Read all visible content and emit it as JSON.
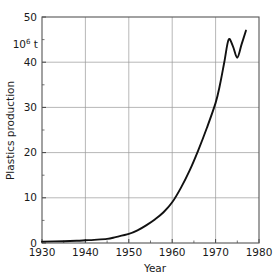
{
  "chart_data": {
    "type": "line",
    "title": "",
    "xlabel": "Year",
    "ylabel": "Plastics production",
    "unit_label": "10",
    "unit_exponent": "6",
    "unit_suffix": " t",
    "xlim": [
      1930,
      1980
    ],
    "ylim": [
      0,
      50
    ],
    "grid": true,
    "legend": "none",
    "x_major_ticks": [
      1930,
      1940,
      1950,
      1960,
      1970,
      1980
    ],
    "x_major_tick_labels": [
      "1930",
      "1940",
      "1950",
      "1960",
      "1970",
      "1980"
    ],
    "x_minor_ticks": [
      1935,
      1945,
      1955,
      1965,
      1975
    ],
    "y_major_ticks": [
      0,
      10,
      20,
      30,
      40,
      50
    ],
    "y_major_tick_labels": [
      "0",
      "10",
      "20",
      "30",
      "40",
      "50"
    ],
    "y_minor_ticks": [
      5,
      15,
      25,
      35,
      45
    ],
    "series": [
      {
        "name": "Plastics production",
        "x": [
          1930,
          1935,
          1938,
          1940,
          1942,
          1945,
          1947,
          1950,
          1952,
          1954,
          1956,
          1958,
          1960,
          1962,
          1964,
          1966,
          1968,
          1970,
          1971,
          1972,
          1973,
          1974,
          1975,
          1976,
          1977
        ],
        "values": [
          0.3,
          0.4,
          0.5,
          0.6,
          0.7,
          0.9,
          1.3,
          2.0,
          2.8,
          3.9,
          5.2,
          6.8,
          9.0,
          12.2,
          16.0,
          20.5,
          25.5,
          31.0,
          35.0,
          40.0,
          45.0,
          43.5,
          41.0,
          44.0,
          47.0
        ]
      }
    ]
  },
  "axes": {
    "x_title": "Year",
    "y_title": "Plastics production"
  }
}
